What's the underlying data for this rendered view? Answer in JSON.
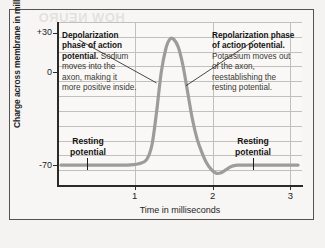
{
  "figure": {
    "bleed_through_text": "HOW NEURO"
  },
  "chart_data": {
    "type": "line",
    "title": "",
    "xlabel": "Time in milliseconds",
    "ylabel": "Charge across membrane in millivolts",
    "xlim": [
      0,
      3.15
    ],
    "ylim": [
      -85,
      38
    ],
    "xticks": [
      "1",
      "2",
      "3"
    ],
    "xtick_values": [
      1,
      2,
      3
    ],
    "yticks": [
      "+30",
      "0",
      "-70"
    ],
    "ytick_values": [
      30,
      0,
      -70
    ],
    "grid": true,
    "legend": "none",
    "series": [
      {
        "name": "Membrane potential",
        "color": "#9d9c99",
        "x": [
          0.05,
          0.3,
          0.6,
          0.9,
          1.05,
          1.15,
          1.22,
          1.28,
          1.34,
          1.4,
          1.45,
          1.5,
          1.56,
          1.62,
          1.68,
          1.74,
          1.8,
          1.86,
          1.92,
          1.98,
          2.04,
          2.1,
          2.16,
          2.24,
          2.32,
          2.45,
          2.65,
          2.9,
          3.1
        ],
        "y": [
          -70,
          -70,
          -70,
          -70,
          -69,
          -66,
          -55,
          -30,
          0,
          18,
          25,
          25,
          19,
          5,
          -15,
          -35,
          -50,
          -60,
          -68,
          -73,
          -76,
          -76,
          -74,
          -71,
          -70,
          -70,
          -70,
          -70,
          -70
        ]
      }
    ],
    "annotations": [
      {
        "id": "depolarization",
        "bold_text": "Depolarization phase of action potential.",
        "body_text": "Sodium moves into the axon, making it more positive inside.",
        "points_to_x": 1.28,
        "points_to_y": -8
      },
      {
        "id": "repolarization",
        "bold_text": "Repolarization phase of action potential.",
        "body_text": "Potassium moves out of the axon, reestablishing the resting potential.",
        "points_to_x": 1.66,
        "points_to_y": -10
      },
      {
        "id": "resting-potential-left",
        "text": "Resting potential",
        "points_to_x": 0.52,
        "points_to_y": -70
      },
      {
        "id": "resting-potential-right",
        "text": "Resting potential",
        "points_to_x": 2.52,
        "points_to_y": -70
      }
    ]
  }
}
